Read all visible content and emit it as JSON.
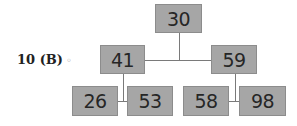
{
  "question_label": {
    "number": "10",
    "answer": "(B)",
    "mark": "◦"
  },
  "tree": {
    "root": "30",
    "level1": [
      "41",
      "59"
    ],
    "level2": [
      "26",
      "53",
      "58",
      "98"
    ],
    "edges": [
      [
        "30",
        "41"
      ],
      [
        "30",
        "59"
      ],
      [
        "41",
        "26"
      ],
      [
        "41",
        "53"
      ],
      [
        "59",
        "58"
      ],
      [
        "59",
        "98"
      ]
    ]
  },
  "colors": {
    "node_fill": "#a6a6a6",
    "node_border": "#8c8c8c",
    "text": "#262626",
    "line": "#7a7a7a"
  }
}
